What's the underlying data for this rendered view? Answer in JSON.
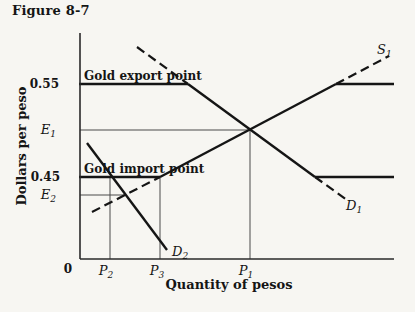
{
  "figure": {
    "title": "Figure 8-7",
    "xlabel": "Quantity of pesos",
    "ylabel": "Dollars per peso"
  },
  "chart_data": {
    "type": "line",
    "title": "Figure 8-7",
    "xlabel": "Quantity of pesos",
    "ylabel": "Dollars per peso",
    "grid": false,
    "legend": false,
    "y_ticks": [
      {
        "label": "0.55",
        "price": 0.55
      },
      {
        "label": "E1",
        "price": 0.5
      },
      {
        "label": "0.45",
        "price": 0.45
      },
      {
        "label": "E2",
        "price": 0.43
      }
    ],
    "x_ticks": [
      {
        "label": "0",
        "quantity": 0
      },
      {
        "label": "P2",
        "quantity": 30
      },
      {
        "label": "P3",
        "quantity": 80
      },
      {
        "label": "P1",
        "quantity": 170
      }
    ],
    "price_levels": {
      "gold_export_point": 0.55,
      "gold_import_point": 0.45
    },
    "series": [
      {
        "name": "S1",
        "kind": "supply",
        "solid_points": [
          [
            80,
            0.45
          ],
          [
            256,
            0.55
          ]
        ],
        "dashed_extension_low": [
          [
            12,
            0.412
          ],
          [
            80,
            0.45
          ]
        ],
        "dashed_extension_high": [
          [
            256,
            0.55
          ],
          [
            309,
            0.58
          ]
        ],
        "effective_horizontal_at": {
          "price": 0.55,
          "from_q": 256,
          "to_q": 314
        }
      },
      {
        "name": "D1",
        "kind": "demand",
        "solid_points": [
          [
            108,
            0.55
          ],
          [
            235,
            0.45
          ]
        ],
        "dashed_extension_high": [
          [
            57,
            0.59
          ],
          [
            108,
            0.55
          ]
        ],
        "dashed_extension_low": [
          [
            235,
            0.45
          ],
          [
            267,
            0.426
          ]
        ],
        "effective_horizontal_at": {
          "price": 0.45,
          "from_q": 235,
          "to_q": 314
        }
      },
      {
        "name": "D2",
        "kind": "demand",
        "solid_points": [
          [
            7,
            0.487
          ],
          [
            87,
            0.371
          ]
        ]
      }
    ],
    "equilibria": [
      {
        "name": "E1",
        "quantity_label": "P1",
        "quantity": 170,
        "price": 0.5
      },
      {
        "name": "E2",
        "quantity_label": "P2",
        "quantity": 30,
        "price": 0.431
      }
    ],
    "annotations": [
      "Gold export point",
      "Gold import point",
      "S1",
      "D1",
      "D2"
    ]
  },
  "render": {
    "width": 415,
    "height": 312,
    "lines": [
      {
        "name": "e1-level-line",
        "style": "thin",
        "points": [
          [
            80,
            130
          ],
          [
            250,
            130
          ]
        ]
      },
      {
        "name": "e2-level-line",
        "style": "thin",
        "points": [
          [
            80,
            195
          ],
          [
            126,
            195
          ]
        ]
      },
      {
        "name": "p1-quantity-line",
        "style": "thin",
        "points": [
          [
            250,
            130
          ],
          [
            250,
            259
          ]
        ]
      },
      {
        "name": "p2-quantity-line",
        "style": "thin",
        "points": [
          [
            110,
            177
          ],
          [
            110,
            259
          ]
        ]
      },
      {
        "name": "p3-quantity-line",
        "style": "thin",
        "points": [
          [
            160,
            177
          ],
          [
            160,
            259
          ]
        ]
      },
      {
        "name": "d1-dashed-upper",
        "style": "dashed",
        "points": [
          [
            137,
            47
          ],
          [
            188,
            84
          ]
        ]
      },
      {
        "name": "d1-dashed-lower",
        "style": "dashed",
        "points": [
          [
            315,
            177
          ],
          [
            347,
            200
          ]
        ]
      },
      {
        "name": "s1-dashed-upper",
        "style": "dashed",
        "points": [
          [
            336,
            84
          ],
          [
            389,
            56
          ]
        ]
      },
      {
        "name": "s1-dashed-lower",
        "style": "dashed",
        "points": [
          [
            92,
            212
          ],
          [
            160,
            177
          ]
        ]
      },
      {
        "name": "gold-export-line",
        "style": "thick",
        "points": [
          [
            79,
            84
          ],
          [
            188,
            84
          ]
        ]
      },
      {
        "name": "d1-curve-solid",
        "style": "thick",
        "points": [
          [
            188,
            84
          ],
          [
            315,
            177
          ]
        ]
      },
      {
        "name": "d1-import-level-segment",
        "style": "thick",
        "points": [
          [
            315,
            177
          ],
          [
            394,
            177
          ]
        ]
      },
      {
        "name": "gold-import-line",
        "style": "thick",
        "points": [
          [
            79,
            177
          ],
          [
            160,
            177
          ]
        ]
      },
      {
        "name": "s1-curve-solid",
        "style": "thick",
        "points": [
          [
            160,
            177
          ],
          [
            336,
            84
          ]
        ]
      },
      {
        "name": "s1-export-level-segment",
        "style": "thick",
        "points": [
          [
            336,
            84
          ],
          [
            394,
            84
          ]
        ]
      },
      {
        "name": "d2-curve",
        "style": "thick",
        "points": [
          [
            87,
            143
          ],
          [
            167,
            250
          ]
        ]
      },
      {
        "name": "y-axis",
        "style": "axis",
        "points": [
          [
            80,
            33
          ],
          [
            80,
            259
          ]
        ]
      },
      {
        "name": "x-axis",
        "style": "axis",
        "points": [
          [
            80,
            259
          ],
          [
            394,
            259
          ]
        ]
      }
    ],
    "labels": [
      {
        "name": "gold-export-label",
        "text": "Gold export point",
        "x": 84,
        "y": 80,
        "anchor": "start",
        "style": "caption"
      },
      {
        "name": "gold-import-label",
        "text": "Gold import point",
        "x": 84,
        "y": 173,
        "anchor": "start",
        "style": "caption"
      },
      {
        "name": "tick-0-55",
        "text": "0.55",
        "x": 59,
        "y": 88,
        "anchor": "end",
        "style": "num"
      },
      {
        "name": "tick-0-45",
        "text": "0.45",
        "x": 60,
        "y": 181,
        "anchor": "end",
        "style": "num"
      },
      {
        "name": "tick-e1",
        "text": "E",
        "sub": "1",
        "x": 56,
        "y": 134,
        "anchor": "end",
        "style": "var"
      },
      {
        "name": "tick-e2",
        "text": "E",
        "sub": "2",
        "x": 56,
        "y": 199,
        "anchor": "end",
        "style": "var"
      },
      {
        "name": "tick-origin",
        "text": "0",
        "x": 68,
        "y": 273,
        "anchor": "middle",
        "style": "num"
      },
      {
        "name": "tick-p2",
        "text": "P",
        "sub": "2",
        "x": 106,
        "y": 275,
        "anchor": "middle",
        "style": "var"
      },
      {
        "name": "tick-p3",
        "text": "P",
        "sub": "3",
        "x": 157,
        "y": 275,
        "anchor": "middle",
        "style": "var"
      },
      {
        "name": "tick-p1",
        "text": "P",
        "sub": "1",
        "x": 246,
        "y": 275,
        "anchor": "middle",
        "style": "var"
      },
      {
        "name": "d2-label",
        "text": "D",
        "sub": "2",
        "x": 172,
        "y": 256,
        "anchor": "start",
        "style": "var"
      },
      {
        "name": "d1-label",
        "text": "D",
        "sub": "1",
        "x": 346,
        "y": 210,
        "anchor": "start",
        "style": "var"
      },
      {
        "name": "s1-label",
        "text": "S",
        "sub": "1",
        "x": 377,
        "y": 54,
        "anchor": "start",
        "style": "var"
      }
    ]
  }
}
